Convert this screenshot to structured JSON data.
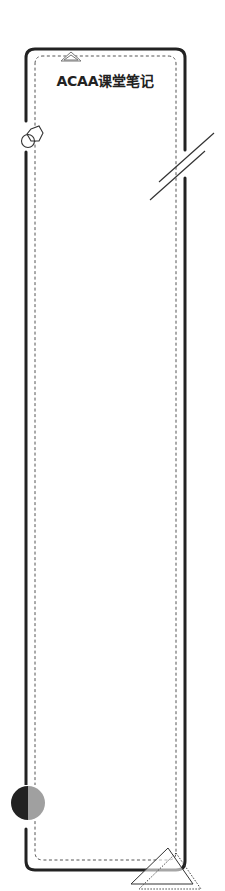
{
  "card": {
    "title": "ACAA课堂笔记"
  },
  "colors": {
    "frame": "#222222",
    "dashed": "#555555",
    "circle_dark": "#222222",
    "circle_light": "#a0a0a0",
    "background": "#ffffff"
  },
  "decorations": {
    "top_triangle": "triangle-outline",
    "left_shapes": [
      "hexagon-outline",
      "circle-outline"
    ],
    "right_slashes": "double-diagonal-lines",
    "bottom_left_circle": "half-filled-circle",
    "bottom_right_triangles": [
      "triangle-solid-outline",
      "triangle-dotted-outline"
    ]
  }
}
